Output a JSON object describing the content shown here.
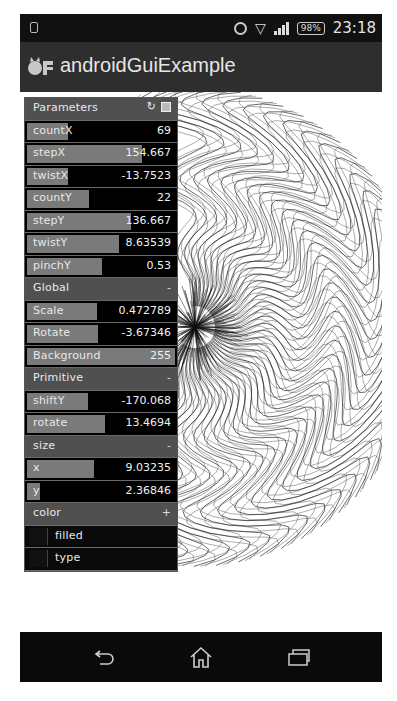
{
  "status_bar": {
    "time": "23:18",
    "battery": "98%",
    "icons": [
      "phone-icon",
      "alarm-icon",
      "wifi-icon",
      "signal-icon",
      "battery-icon"
    ]
  },
  "action_bar": {
    "title": "androidGuiExample",
    "logo": "openframeworks-logo"
  },
  "panel": {
    "title": "Parameters",
    "header_icons": [
      "refresh-icon",
      "save-icon"
    ],
    "rows": [
      {
        "type": "slider",
        "label": "countX",
        "value": "69",
        "fill": 0.28
      },
      {
        "type": "slider",
        "label": "stepX",
        "value": "154.667",
        "fill": 0.78
      },
      {
        "type": "slider",
        "label": "twistX",
        "value": "-13.7523",
        "fill": 0.28
      },
      {
        "type": "slider",
        "label": "countY",
        "value": "22",
        "fill": 0.42
      },
      {
        "type": "slider",
        "label": "stepY",
        "value": "136.667",
        "fill": 0.7
      },
      {
        "type": "slider",
        "label": "twistY",
        "value": "8.63539",
        "fill": 0.62
      },
      {
        "type": "slider",
        "label": "pinchY",
        "value": "0.53",
        "fill": 0.51
      },
      {
        "type": "group",
        "label": "Global",
        "right": "-"
      },
      {
        "type": "slider",
        "label": "Scale",
        "value": "0.472789",
        "fill": 0.47
      },
      {
        "type": "slider",
        "label": "Rotate",
        "value": "-3.67346",
        "fill": 0.48
      },
      {
        "type": "slider",
        "label": "Background",
        "value": "255",
        "fill": 1.0
      },
      {
        "type": "group",
        "label": "Primitive",
        "right": "-"
      },
      {
        "type": "slider",
        "label": "shiftY",
        "value": "-170.068",
        "fill": 0.41
      },
      {
        "type": "slider",
        "label": "rotate",
        "value": "13.4694",
        "fill": 0.53
      },
      {
        "type": "group",
        "label": "size",
        "right": "-"
      },
      {
        "type": "slider",
        "label": "x",
        "value": "9.03235",
        "fill": 0.45
      },
      {
        "type": "slider",
        "label": "y",
        "value": "2.36846",
        "fill": 0.09
      },
      {
        "type": "group",
        "label": "color",
        "right": "+"
      },
      {
        "type": "toggle",
        "label": "filled"
      },
      {
        "type": "toggle",
        "label": "type"
      }
    ]
  },
  "nav_bar": {
    "buttons": [
      "back",
      "home",
      "recent-apps"
    ]
  }
}
